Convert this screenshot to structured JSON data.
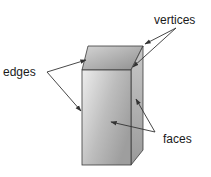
{
  "diagram": {
    "labels": {
      "vertices": "vertices",
      "edges": "edges",
      "faces": "faces"
    },
    "colors": {
      "stroke": "#3a3a3a",
      "front_face_light": "#e6e6e6",
      "front_face_dark": "#a8a8a8",
      "top_face_light": "#cfcfcf",
      "top_face_dark": "#9a9a9a",
      "side_face_light": "#c4c4c4",
      "side_face_dark": "#8e8e8e",
      "arrow": "#333333",
      "text": "#1a1a1a"
    }
  }
}
